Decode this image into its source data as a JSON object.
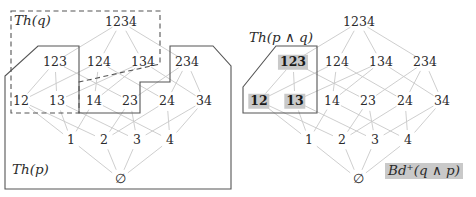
{
  "figure": {
    "type": "diagram",
    "node_edge_color": "#c8c8c8",
    "boundary_color": "#555555",
    "highlight_color": "#c9c9c9",
    "text_color": "#2b2b2b"
  },
  "left": {
    "regions": [
      {
        "name": "Th(q)",
        "label": "Th(q)",
        "style": "dashed"
      },
      {
        "name": "Th(p)",
        "label": "Th(p)",
        "style": "solid"
      }
    ],
    "nodes": [
      {
        "id": "1234",
        "label": "1234",
        "x": 121,
        "y": 22,
        "rank": 4
      },
      {
        "id": "123",
        "label": "123",
        "x": 55,
        "y": 62,
        "rank": 3
      },
      {
        "id": "124",
        "label": "124",
        "x": 99,
        "y": 62,
        "rank": 3
      },
      {
        "id": "134",
        "label": "134",
        "x": 143,
        "y": 62,
        "rank": 3
      },
      {
        "id": "234",
        "label": "234",
        "x": 187,
        "y": 62,
        "rank": 3
      },
      {
        "id": "12",
        "label": "12",
        "x": 21,
        "y": 101,
        "rank": 2
      },
      {
        "id": "13",
        "label": "13",
        "x": 57,
        "y": 101,
        "rank": 2
      },
      {
        "id": "14",
        "label": "14",
        "x": 94,
        "y": 101,
        "rank": 2
      },
      {
        "id": "23",
        "label": "23",
        "x": 130,
        "y": 101,
        "rank": 2
      },
      {
        "id": "24",
        "label": "24",
        "x": 167,
        "y": 101,
        "rank": 2
      },
      {
        "id": "34",
        "label": "34",
        "x": 204,
        "y": 101,
        "rank": 2
      },
      {
        "id": "1",
        "label": "1",
        "x": 71,
        "y": 140,
        "rank": 1
      },
      {
        "id": "2",
        "label": "2",
        "x": 104,
        "y": 140,
        "rank": 1
      },
      {
        "id": "3",
        "label": "3",
        "x": 137,
        "y": 140,
        "rank": 1
      },
      {
        "id": "4",
        "label": "4",
        "x": 170,
        "y": 140,
        "rank": 1
      },
      {
        "id": "0",
        "label": "∅",
        "x": 120,
        "y": 179,
        "rank": 0
      }
    ],
    "highlighted_nodes": []
  },
  "right": {
    "regions": [
      {
        "name": "Th(p and q)",
        "label": "Th(p ∧ q)",
        "style": "solid"
      }
    ],
    "badge": {
      "name": "Bd+(q and p)",
      "label": "Bd⁺(q ∧ p)"
    },
    "nodes": [
      {
        "id": "1234",
        "label": "1234",
        "x": 359,
        "y": 22,
        "rank": 4
      },
      {
        "id": "123",
        "label": "123",
        "x": 293,
        "y": 62,
        "rank": 3,
        "highlight": true
      },
      {
        "id": "124",
        "label": "124",
        "x": 337,
        "y": 62,
        "rank": 3
      },
      {
        "id": "134",
        "label": "134",
        "x": 381,
        "y": 62,
        "rank": 3
      },
      {
        "id": "234",
        "label": "234",
        "x": 425,
        "y": 62,
        "rank": 3
      },
      {
        "id": "12",
        "label": "12",
        "x": 259,
        "y": 101,
        "rank": 2,
        "highlight": true
      },
      {
        "id": "13",
        "label": "13",
        "x": 295,
        "y": 101,
        "rank": 2,
        "highlight": true
      },
      {
        "id": "14",
        "label": "14",
        "x": 332,
        "y": 101,
        "rank": 2
      },
      {
        "id": "23",
        "label": "23",
        "x": 368,
        "y": 101,
        "rank": 2
      },
      {
        "id": "24",
        "label": "24",
        "x": 405,
        "y": 101,
        "rank": 2
      },
      {
        "id": "34",
        "label": "34",
        "x": 442,
        "y": 101,
        "rank": 2
      },
      {
        "id": "1",
        "label": "1",
        "x": 309,
        "y": 140,
        "rank": 1
      },
      {
        "id": "2",
        "label": "2",
        "x": 342,
        "y": 140,
        "rank": 1
      },
      {
        "id": "3",
        "label": "3",
        "x": 375,
        "y": 140,
        "rank": 1
      },
      {
        "id": "4",
        "label": "4",
        "x": 408,
        "y": 140,
        "rank": 1
      },
      {
        "id": "0",
        "label": "∅",
        "x": 358,
        "y": 179,
        "rank": 0
      }
    ],
    "highlighted_nodes": [
      "123",
      "12",
      "13"
    ]
  },
  "edges": [
    [
      "1234",
      "123"
    ],
    [
      "1234",
      "124"
    ],
    [
      "1234",
      "134"
    ],
    [
      "1234",
      "234"
    ],
    [
      "123",
      "12"
    ],
    [
      "123",
      "13"
    ],
    [
      "123",
      "23"
    ],
    [
      "124",
      "12"
    ],
    [
      "124",
      "14"
    ],
    [
      "124",
      "24"
    ],
    [
      "134",
      "13"
    ],
    [
      "134",
      "14"
    ],
    [
      "134",
      "34"
    ],
    [
      "234",
      "23"
    ],
    [
      "234",
      "24"
    ],
    [
      "234",
      "34"
    ],
    [
      "12",
      "1"
    ],
    [
      "12",
      "2"
    ],
    [
      "13",
      "1"
    ],
    [
      "13",
      "3"
    ],
    [
      "14",
      "1"
    ],
    [
      "14",
      "4"
    ],
    [
      "23",
      "2"
    ],
    [
      "23",
      "3"
    ],
    [
      "24",
      "2"
    ],
    [
      "24",
      "4"
    ],
    [
      "34",
      "3"
    ],
    [
      "34",
      "4"
    ],
    [
      "1",
      "0"
    ],
    [
      "2",
      "0"
    ],
    [
      "3",
      "0"
    ],
    [
      "4",
      "0"
    ]
  ]
}
